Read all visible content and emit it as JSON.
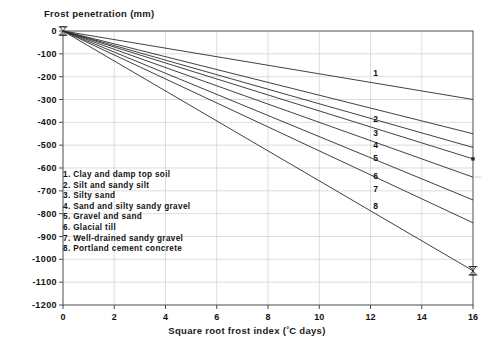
{
  "chart_data": {
    "type": "line",
    "title": "",
    "xlabel": "Square root frost index (°C days)",
    "ylabel": "Frost penetration (mm)",
    "xlim": [
      0,
      16
    ],
    "ylim": [
      -1200,
      0
    ],
    "grid": true,
    "legend_position": "inside-left",
    "x_ticks": [
      "0",
      "2",
      "4",
      "6",
      "8",
      "10",
      "12",
      "14",
      "16"
    ],
    "x_tick_values": [
      0,
      2,
      4,
      6,
      8,
      10,
      12,
      14,
      16
    ],
    "y_ticks": [
      "0",
      "-100",
      "-200",
      "-300",
      "-400",
      "-500",
      "-600",
      "-700",
      "-800",
      "-900",
      "-1000",
      "-1100",
      "-1200"
    ],
    "y_tick_values": [
      0,
      -100,
      -200,
      -300,
      -400,
      -500,
      -600,
      -700,
      -800,
      -900,
      -1000,
      -1100,
      -1200
    ],
    "x": [
      0,
      16
    ],
    "series": [
      {
        "name": "1. Clay and damp top soil",
        "number": "1",
        "values": [
          0,
          -300
        ],
        "slope": -18.75,
        "label_x": 12.2,
        "label_y": -185
      },
      {
        "name": "2. Silt and sandy silt",
        "number": "2",
        "values": [
          0,
          -450
        ],
        "slope": -28.1,
        "label_x": 12.2,
        "label_y": -385
      },
      {
        "name": "3. Silty sand",
        "number": "3",
        "values": [
          0,
          -510
        ],
        "slope": -31.9,
        "label_x": 12.2,
        "label_y": -445
      },
      {
        "name": "4. Sand and silty sandy gravel",
        "number": "4",
        "values": [
          0,
          -560
        ],
        "slope": -35.0,
        "label_x": 12.2,
        "label_y": -500
      },
      {
        "name": "5. Gravel and sand",
        "number": "5",
        "values": [
          0,
          -640
        ],
        "slope": -40.0,
        "label_x": 12.2,
        "label_y": -555
      },
      {
        "name": "6. Glacial till",
        "number": "6",
        "values": [
          0,
          -740
        ],
        "slope": -46.3,
        "label_x": 12.2,
        "label_y": -635
      },
      {
        "name": "7. Well-drained sandy gravel",
        "number": "7",
        "values": [
          0,
          -840
        ],
        "slope": -52.5,
        "label_x": 12.2,
        "label_y": -690
      },
      {
        "name": "8. Portland cement concrete",
        "number": "8",
        "values": [
          0,
          -1050
        ],
        "slope": -65.6,
        "label_x": 12.2,
        "label_y": -765
      }
    ],
    "annotations": [
      {
        "text": "marker at x=0, y=0",
        "x": 0,
        "y": 0
      },
      {
        "text": "marker at x=16, y=-1050",
        "x": 16,
        "y": -1050
      }
    ]
  },
  "legend": {
    "items": [
      "1. Clay and damp top soil",
      "2. Silt and sandy silt",
      "3. Silty sand",
      "4. Sand and silty sandy gravel",
      "5. Gravel and sand",
      "6. Glacial till",
      "7. Well-drained sandy gravel",
      "8. Portland cement concrete"
    ]
  },
  "axis_titles": {
    "y": "Frost penetration (mm)",
    "x_prefix": "Square root frost index (",
    "x_degree": "°",
    "x_suffix": "C days)"
  },
  "colors": {
    "line": "#2b2b2b",
    "axis": "#4d4d4d",
    "grid": "#c8c8c8",
    "text": "#111111",
    "background": "#ffffff"
  }
}
